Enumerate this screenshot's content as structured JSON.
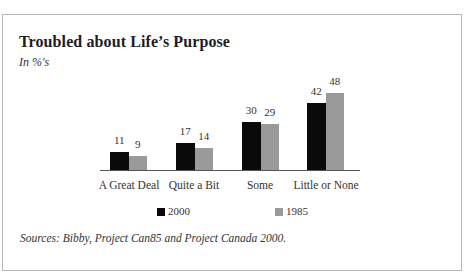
{
  "chart_data": {
    "type": "bar",
    "title": "Troubled about Life’s Purpose",
    "subtitle": "In %'s",
    "categories": [
      "A Great Deal",
      "Quite a Bit",
      "Some",
      "Little or None"
    ],
    "series": [
      {
        "name": "2000",
        "color": "#0a0a0a",
        "values": [
          11,
          17,
          30,
          42
        ]
      },
      {
        "name": "1985",
        "color": "#9a9a9a",
        "values": [
          9,
          14,
          29,
          48
        ]
      }
    ],
    "xlabel": "",
    "ylabel": "",
    "ylim": [
      0,
      50
    ],
    "grid": false,
    "legend_position": "bottom",
    "source": "Sources: Bibby, Project Can85 and Project Canada 2000."
  },
  "labels": {
    "title": "Troubled about Life’s Purpose",
    "subtitle": "In %'s",
    "source": "Sources: Bibby, Project Can85 and Project Canada 2000.",
    "legend": [
      "2000",
      "1985"
    ]
  }
}
